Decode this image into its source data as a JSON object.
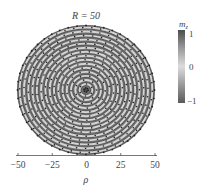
{
  "chart_data": {
    "type": "heatmap",
    "title": "R = 50",
    "xlabel": "ρ",
    "ylabel": "",
    "xlim": [
      -50,
      50
    ],
    "x_ticks": [
      -50,
      -25,
      0,
      25,
      50
    ],
    "x_tick_labels": [
      "−50",
      "−25",
      "0",
      "25",
      "50"
    ],
    "colorbar": {
      "label": "m_z",
      "label_main": "m",
      "label_sub": "z",
      "range": [
        -1,
        1
      ],
      "ticks": [
        1,
        0,
        -1
      ],
      "tick_labels": [
        "1",
        "0",
        "−1"
      ],
      "colors": {
        "high": "#4d4d4d",
        "mid": "#d9d9d9",
        "low": "#5a5a5a"
      }
    },
    "pattern": {
      "description": "Concentric target-skyrmion rings on a circular disk of radius R = 50; m_z alternates between -1 (dark) and +1 (dark grey) with light (m_z≈0) transition bands carrying in-plane spin arrows (dots).",
      "center_value": -1,
      "ring_count": 8,
      "ring_period_rho": 6.2,
      "disk_radius_rho": 50
    },
    "grid": false,
    "legend": "colorbar right"
  }
}
